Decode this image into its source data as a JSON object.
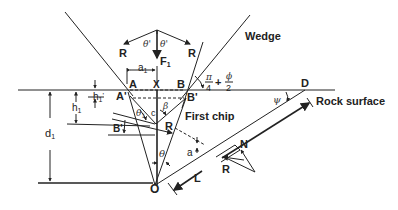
{
  "diagram": {
    "labels": {
      "wedge": "Wedge",
      "rock_surface": "Rock surface",
      "first_chip": "First chip",
      "point_A": "A",
      "point_A_prime": "A'",
      "point_B": "B",
      "point_B_prime": "B'",
      "point_B_prime_left": "B'",
      "point_X": "X",
      "point_D": "D",
      "point_O": "O",
      "point_N": "N",
      "force_R_left": "R",
      "force_R_right": "R",
      "force_R_chip": "R",
      "force_R_plane": "R",
      "force_F1": "F",
      "force_F1_sub": "1",
      "a1": "a",
      "a1_sub": "1",
      "h1": "h",
      "h1_sub": "1",
      "h1_prime": "h",
      "h1_prime_sub": "1",
      "h1_prime_mark": "'",
      "d1": "d",
      "d1_sub": "1",
      "theta_prime_left": "θ'",
      "theta_prime_right": "θ'",
      "theta1": "θ",
      "theta1_sub": "1",
      "theta": "θ",
      "beta": "β",
      "c": "c",
      "a": "a",
      "psi": "ψ",
      "L": "L",
      "angle_formula_pi": "π",
      "angle_formula_4": "4",
      "angle_formula_plus": "+",
      "angle_formula_phi": "ϕ",
      "angle_formula_2": "2"
    }
  }
}
